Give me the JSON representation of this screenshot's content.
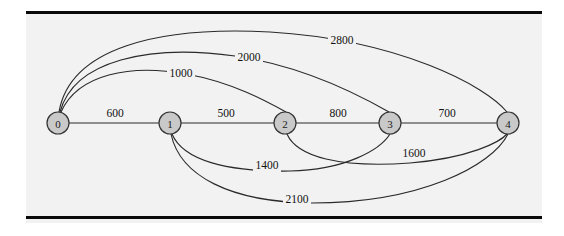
{
  "figure": {
    "type": "weighted-graph-diagram",
    "background_color": "#f2f2f2",
    "rule_color": "#0a0a0a",
    "node_fill": "#c9c9c9",
    "node_stroke": "#333333",
    "edge_color": "#2a2a2a"
  },
  "graph_data": {
    "type": "graph",
    "title": "",
    "directed": false,
    "nodes": [
      {
        "id": "n0",
        "label": "0",
        "x": 58,
        "y": 123,
        "r": 11
      },
      {
        "id": "n1",
        "label": "1",
        "x": 170,
        "y": 123,
        "r": 11
      },
      {
        "id": "n2",
        "label": "2",
        "x": 285,
        "y": 123,
        "r": 11
      },
      {
        "id": "n3",
        "label": "3",
        "x": 390,
        "y": 123,
        "r": 11
      },
      {
        "id": "n4",
        "label": "4",
        "x": 508,
        "y": 123,
        "r": 11
      }
    ],
    "edges": [
      {
        "id": "e01",
        "from": "0",
        "to": "1",
        "weight": "600",
        "shape": "straight",
        "path": "M 69 123 L 159 123",
        "label_x": 115,
        "label_y": 113
      },
      {
        "id": "e12",
        "from": "1",
        "to": "2",
        "weight": "500",
        "shape": "straight",
        "path": "M 181 123 L 274 123",
        "label_x": 226,
        "label_y": 113
      },
      {
        "id": "e23",
        "from": "2",
        "to": "3",
        "weight": "800",
        "shape": "straight",
        "path": "M 296 123 L 379 123",
        "label_x": 338,
        "label_y": 113
      },
      {
        "id": "e34",
        "from": "3",
        "to": "4",
        "weight": "700",
        "shape": "straight",
        "path": "M 401 123 L 497 123",
        "label_x": 447,
        "label_y": 113
      },
      {
        "id": "e02",
        "from": "0",
        "to": "2",
        "weight": "1000",
        "shape": "arc-above",
        "path": "M 61 112 C 78 74 130 64 186 74 C 232 82 268 102 286 112",
        "label_x": 181,
        "label_y": 73
      },
      {
        "id": "e03",
        "from": "0",
        "to": "3",
        "weight": "2000",
        "shape": "arc-above",
        "path": "M 60 112 C 74 60 150 44 235 56 C 310 67 368 100 389 112",
        "label_x": 249,
        "label_y": 57
      },
      {
        "id": "e04",
        "from": "0",
        "to": "4",
        "weight": "2800",
        "shape": "arc-above",
        "path": "M 59 112 C 70 48 158 26 270 32 C 400 40 486 86 507 112",
        "label_x": 342,
        "label_y": 40
      },
      {
        "id": "e13",
        "from": "1",
        "to": "3",
        "weight": "1400",
        "shape": "arc-below",
        "path": "M 172 134 C 183 160 226 172 290 171 C 345 170 380 150 390 134",
        "label_x": 267,
        "label_y": 165
      },
      {
        "id": "e24",
        "from": "2",
        "to": "4",
        "weight": "1600",
        "shape": "arc-below",
        "path": "M 287 134 C 297 157 340 168 410 163 C 470 158 500 142 507 134",
        "label_x": 414,
        "label_y": 153
      },
      {
        "id": "e14",
        "from": "1",
        "to": "4",
        "weight": "2100",
        "shape": "arc-below",
        "path": "M 171 134 C 180 176 230 202 312 203 C 420 203 492 166 508 134",
        "label_x": 297,
        "label_y": 199
      }
    ]
  }
}
